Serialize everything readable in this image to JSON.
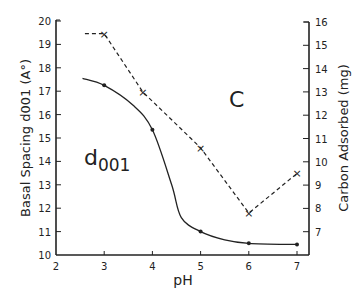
{
  "chart_data": {
    "type": "line",
    "title": "",
    "xlabel": "pH",
    "ylabel": "Basal Spacing d001 (A°)",
    "ylabel_right": "Carbon Adsorbed (mg)",
    "xlim": [
      2,
      7
    ],
    "ylim": [
      10,
      20
    ],
    "ylim_right": [
      6,
      16
    ],
    "x_ticks": [
      2,
      3,
      4,
      5,
      6,
      7
    ],
    "y_ticks": [
      10,
      11,
      12,
      13,
      14,
      15,
      16,
      17,
      18,
      19,
      20
    ],
    "y_ticks_right": [
      7,
      8,
      9,
      10,
      11,
      12,
      13,
      14,
      15,
      16
    ],
    "grid": false,
    "annotations": [
      {
        "text": "C",
        "x": 5.75,
        "y_right": 13.5
      },
      {
        "text": "d001",
        "x": 2.9,
        "y": 14.4
      }
    ],
    "series": [
      {
        "name": "d001",
        "axis": "left",
        "style": "solid",
        "marker": "dot",
        "x": [
          3,
          4,
          5,
          6,
          7
        ],
        "values": [
          17.25,
          15.35,
          11.0,
          10.5,
          10.45
        ],
        "curve_start": {
          "x": 2.55,
          "y": 17.55
        }
      },
      {
        "name": "C",
        "axis": "right",
        "style": "dashed",
        "marker": "x",
        "x": [
          3,
          3.8,
          5,
          6,
          7
        ],
        "values": [
          15.5,
          13.0,
          10.6,
          7.8,
          9.5
        ],
        "line_start": {
          "x": 2.6,
          "y": 15.5
        }
      }
    ]
  }
}
